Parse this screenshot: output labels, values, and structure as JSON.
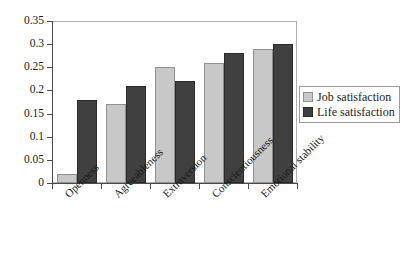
{
  "chart_data": {
    "type": "bar",
    "title": "",
    "xlabel": "",
    "ylabel": "",
    "categories": [
      "Openness",
      "Agreeableness",
      "Extraversion",
      "Conscientiousness",
      "Emotional stability"
    ],
    "series": [
      {
        "name": "Job satisfaction",
        "color": "#c8c8c8",
        "values": [
          0.02,
          0.17,
          0.25,
          0.26,
          0.29
        ]
      },
      {
        "name": "Life satisfaction",
        "color": "#404040",
        "values": [
          0.18,
          0.21,
          0.22,
          0.28,
          0.3
        ]
      }
    ],
    "ylim": [
      0,
      0.35
    ],
    "ytick_values": [
      0,
      0.05,
      0.1,
      0.15,
      0.2,
      0.25,
      0.3,
      0.35
    ],
    "ytick_labels": [
      "0",
      "0.05",
      "0.1",
      "0.15",
      "0.2",
      "0.25",
      "0.3",
      "0.35"
    ],
    "grid": false,
    "legend_position": "right",
    "xlabel_rotation": -45
  }
}
